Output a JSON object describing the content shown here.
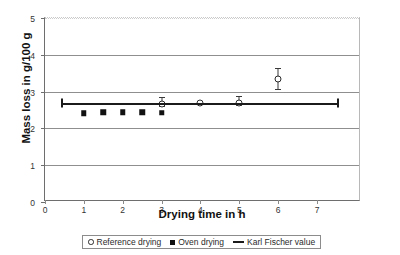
{
  "chart_data": {
    "type": "scatter",
    "title": "",
    "xlabel": "Drying time in h",
    "ylabel": "Mass loss in g/100 g",
    "xlim": [
      0,
      8.13
    ],
    "ylim": [
      0,
      5
    ],
    "xticks": [
      "0",
      "1",
      "2",
      "3",
      "4",
      "5",
      "6",
      "7"
    ],
    "xtick_values": [
      0,
      1,
      2,
      3,
      4,
      5,
      6,
      7
    ],
    "yticks": [
      "0",
      "1",
      "2",
      "3",
      "4",
      "5"
    ],
    "ytick_values": [
      0,
      1,
      2,
      3,
      4,
      5
    ],
    "grid": "horizontal",
    "legend_position": "below-axes",
    "series": [
      {
        "name": "Reference drying",
        "marker": "open-circle",
        "points": [
          {
            "x": 3.0,
            "y": 2.66,
            "yerr_low": 0.06,
            "yerr_high": 0.18
          },
          {
            "x": 4.0,
            "y": 2.7,
            "yerr_low": 0.0,
            "yerr_high": 0.0
          },
          {
            "x": 5.0,
            "y": 2.7,
            "yerr_low": 0.06,
            "yerr_high": 0.17
          },
          {
            "x": 6.0,
            "y": 3.35,
            "yerr_low": 0.27,
            "yerr_high": 0.3
          }
        ]
      },
      {
        "name": "Oven drying",
        "marker": "filled-square",
        "points": [
          {
            "x": 1.0,
            "y": 2.41
          },
          {
            "x": 1.5,
            "y": 2.44
          },
          {
            "x": 2.0,
            "y": 2.44
          },
          {
            "x": 2.5,
            "y": 2.44
          },
          {
            "x": 3.0,
            "y": 2.43
          }
        ]
      },
      {
        "name": "Karl Fischer value",
        "marker": "line",
        "value": 2.7,
        "x_start": 0.45,
        "x_end": 7.55
      }
    ]
  },
  "legend": {
    "entries": [
      {
        "label": "Reference drying",
        "icon": "open-circle-icon"
      },
      {
        "label": "Oven drying",
        "icon": "filled-square-icon"
      },
      {
        "label": "Karl Fischer value",
        "icon": "line-swatch-icon"
      }
    ]
  },
  "axes": {
    "x_title": "Drying time in h",
    "y_title": "Mass loss in g/100 g"
  }
}
